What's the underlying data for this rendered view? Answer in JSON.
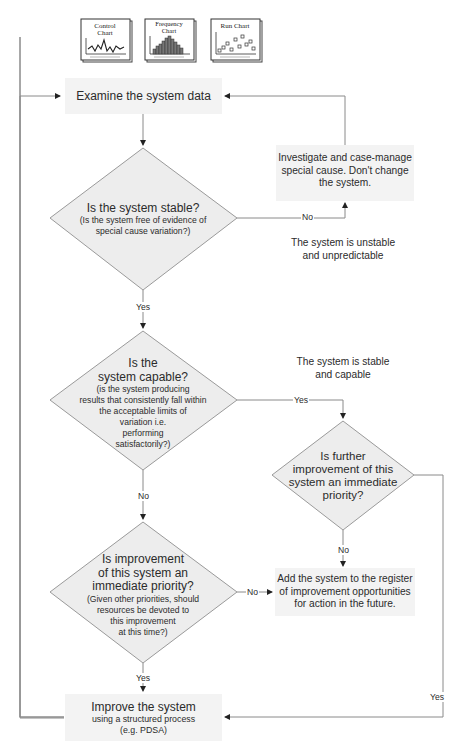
{
  "header_icons": [
    {
      "name": "control-chart",
      "label_line1": "Control",
      "label_line2": "Chart"
    },
    {
      "name": "frequency-chart",
      "label_line1": "Frequency",
      "label_line2": "Chart"
    },
    {
      "name": "run-chart",
      "label_line1": "Run Chart",
      "label_line2": ""
    }
  ],
  "nodes": {
    "examine": {
      "text": "Examine the system data"
    },
    "stable": {
      "title": "Is the system stable?",
      "sub_line1": "(Is the system free of evidence of",
      "sub_line2": "special cause variation?)"
    },
    "investigate": {
      "line1": "Investigate and case-manage",
      "line2": "special cause. Don't change",
      "line3": "the system."
    },
    "capable": {
      "title_line1": "Is the",
      "title_line2": "system capable?",
      "sub_line1": "(is the system producing",
      "sub_line2": "results that consistently fall within",
      "sub_line3": "the acceptable limits of",
      "sub_line4": "variation i.e.",
      "sub_line5": "performing",
      "sub_line6": "satisfactorily?)"
    },
    "further": {
      "line1": "Is further",
      "line2": "improvement of this",
      "line3": "system an immediate",
      "line4": "priority?"
    },
    "priority": {
      "title_line1": "Is improvement",
      "title_line2": "of this system an",
      "title_line3": "immediate priority?",
      "sub_line1": "(Given other priorities, should",
      "sub_line2": "resources be devoted to",
      "sub_line3": "this improvement",
      "sub_line4": "at this time?)"
    },
    "register": {
      "line1": "Add the system to the register",
      "line2": "of improvement opportunities",
      "line3": "for action in the future."
    },
    "improve": {
      "title": "Improve the system",
      "sub_line1": "using a structured process",
      "sub_line2": "(e.g. PDSA)"
    }
  },
  "notes": {
    "unstable": {
      "line1": "The system is unstable",
      "line2": "and unpredictable"
    },
    "stable_capable": {
      "line1": "The system is stable",
      "line2": "and capable"
    }
  },
  "edges": {
    "stable_no": "No",
    "stable_yes": "Yes",
    "capable_yes": "Yes",
    "capable_no": "No",
    "further_no": "No",
    "further_yes": "Yes",
    "priority_no": "No",
    "priority_yes": "Yes"
  },
  "colors": {
    "line": "#8a8a8a",
    "box_fill": "#f3f3f3",
    "diamond_fill": "#ededed",
    "diamond_stroke": "#9a9a9a",
    "text": "#2b2b2b"
  }
}
